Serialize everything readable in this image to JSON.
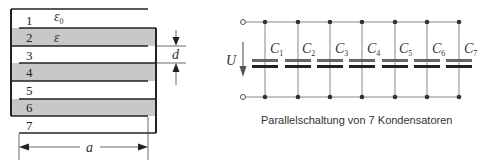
{
  "left_diagram": {
    "layer_labels": [
      "1",
      "2",
      "3",
      "4",
      "5",
      "6",
      "7"
    ],
    "permittivity_vacuum": "ε",
    "permittivity_vacuum_sub": "0",
    "permittivity_dielectric": "ε",
    "thickness_label": "d",
    "width_label": "a",
    "colors": {
      "dielectric_fill": "#c8c8c8",
      "plate": "#222222"
    }
  },
  "right_diagram": {
    "voltage_label": "U",
    "capacitors": [
      {
        "label": "C",
        "sub": "1"
      },
      {
        "label": "C",
        "sub": "2"
      },
      {
        "label": "C",
        "sub": "3"
      },
      {
        "label": "C",
        "sub": "4"
      },
      {
        "label": "C",
        "sub": "5"
      },
      {
        "label": "C",
        "sub": "6"
      },
      {
        "label": "C",
        "sub": "7"
      }
    ],
    "caption": "Parallelschaltung von 7 Kondensatoren",
    "colors": {
      "wire": "#888888",
      "plate_top": "#666666",
      "plate_bottom": "#222222"
    }
  }
}
